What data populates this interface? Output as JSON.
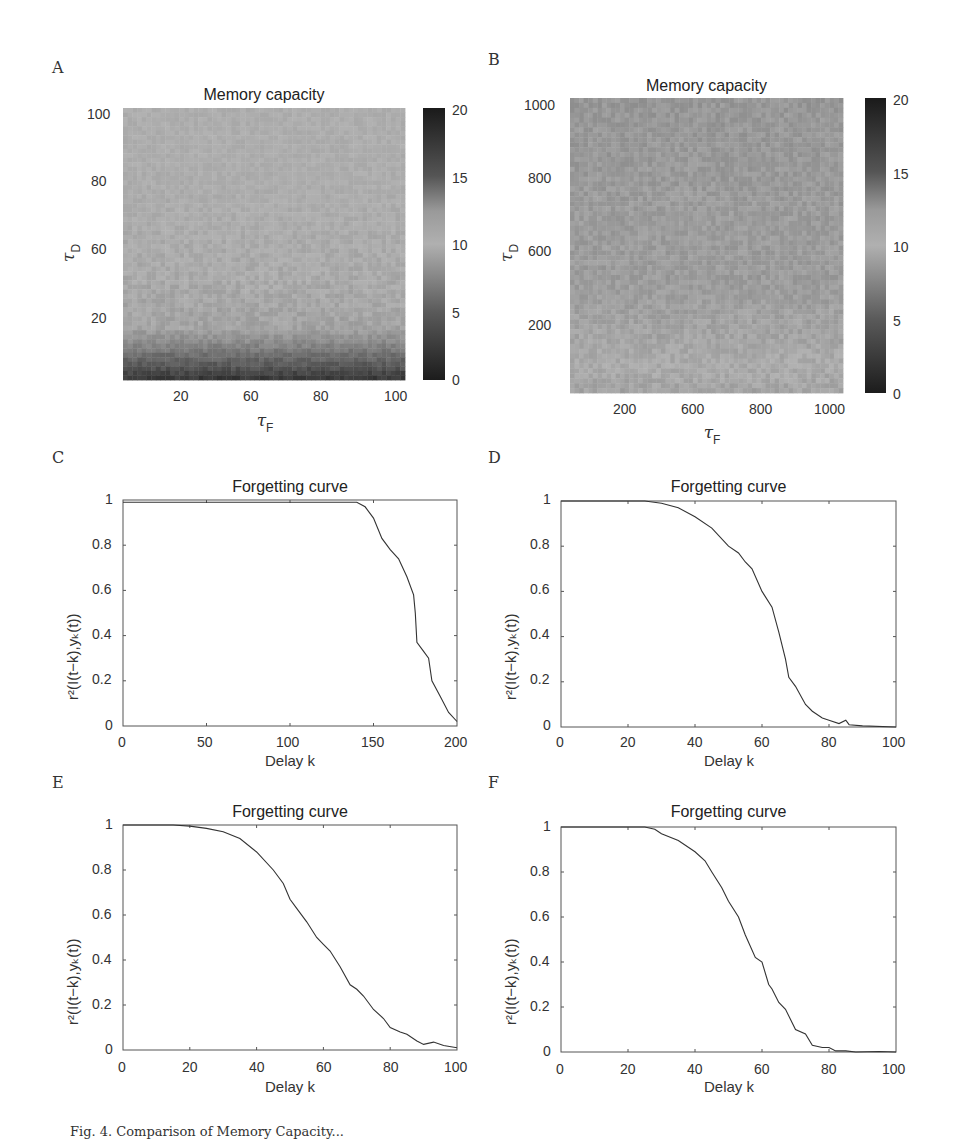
{
  "figure": {
    "caption_partial": "Fig. 4. Comparison of Memory Capacity...",
    "colors": {
      "line": "#333333",
      "axis": "#555555",
      "heat_low": "#1a1a1a",
      "heat_high_mid": "#9a9a9a"
    }
  },
  "panels": {
    "A": {
      "letter": "A",
      "title": "Memory capacity",
      "xlabel": "τ",
      "xlabel_sub": "F",
      "ylabel": "τ",
      "ylabel_sub": "D",
      "xticks": [
        "20",
        "60",
        "80",
        "100"
      ],
      "yticks": [
        "100",
        "80",
        "60",
        "20"
      ],
      "cbar_ticks": [
        "20",
        "15",
        "10",
        "5",
        "0"
      ]
    },
    "B": {
      "letter": "B",
      "title": "Memory capacity",
      "xlabel": "τ",
      "xlabel_sub": "F",
      "ylabel": "τ",
      "ylabel_sub": "D",
      "xticks": [
        "200",
        "600",
        "800",
        "1000"
      ],
      "yticks": [
        "1000",
        "800",
        "600",
        "200"
      ],
      "cbar_ticks": [
        "20",
        "15",
        "10",
        "5",
        "0"
      ]
    },
    "C": {
      "letter": "C",
      "title": "Forgetting curve",
      "xlabel": "Delay k",
      "ylabel": "r²(I(t−k),yₖ(t))",
      "xticks": [
        "0",
        "50",
        "100",
        "150",
        "200"
      ],
      "yticks": [
        "1",
        "0.8",
        "0.6",
        "0.4",
        "0.2",
        "0"
      ]
    },
    "D": {
      "letter": "D",
      "title": "Forgetting curve",
      "xlabel": "Delay k",
      "ylabel": "r²(I(t−k),yₖ(t))",
      "xticks": [
        "0",
        "20",
        "40",
        "60",
        "80",
        "100"
      ],
      "yticks": [
        "1",
        "0.8",
        "0.6",
        "0.4",
        "0.2",
        "0"
      ]
    },
    "E": {
      "letter": "E",
      "title": "Forgetting curve",
      "xlabel": "Delay k",
      "ylabel": "r²(I(t−k),yₖ(t))",
      "xticks": [
        "0",
        "20",
        "40",
        "60",
        "80",
        "100"
      ],
      "yticks": [
        "1",
        "0.8",
        "0.6",
        "0.4",
        "0.2",
        "0"
      ]
    },
    "F": {
      "letter": "F",
      "title": "Forgetting curve",
      "xlabel": "Delay k",
      "ylabel": "r²(I(t−k),yₖ(t))",
      "xticks": [
        "0",
        "20",
        "40",
        "60",
        "80",
        "100"
      ],
      "yticks": [
        "1",
        "0.8",
        "0.6",
        "0.4",
        "0.2",
        "0"
      ]
    }
  },
  "chart_data": [
    {
      "panel": "A",
      "type": "heatmap",
      "title": "Memory capacity",
      "xlabel": "τF",
      "ylabel": "τD",
      "xlim": [
        1,
        100
      ],
      "ylim": [
        1,
        100
      ],
      "xticks": [
        20,
        60,
        80,
        100
      ],
      "yticks": [
        20,
        60,
        80,
        100
      ],
      "colorbar": {
        "range": [
          0,
          20
        ],
        "ticks": [
          0,
          5,
          10,
          15,
          20
        ],
        "colormap": "gray (dark=high at 20, dark=low at 0, light≈10)"
      },
      "row_profile_tauD": [
        1,
        5,
        10,
        15,
        20,
        40,
        60,
        80,
        100
      ],
      "row_values": [
        1.5,
        3.5,
        5.5,
        7.5,
        9,
        9.5,
        9.8,
        10,
        10
      ]
    },
    {
      "panel": "B",
      "type": "heatmap",
      "title": "Memory capacity",
      "xlabel": "τF",
      "ylabel": "τD",
      "xlim": [
        1,
        1000
      ],
      "ylim": [
        1,
        1000
      ],
      "xticks": [
        200,
        600,
        800,
        1000
      ],
      "yticks": [
        200,
        600,
        800,
        1000
      ],
      "colorbar": {
        "range": [
          0,
          20
        ],
        "ticks": [
          0,
          5,
          10,
          15,
          20
        ]
      },
      "row_profile_tauD": [
        1,
        100,
        200,
        400,
        600,
        800,
        1000
      ],
      "row_values": [
        9,
        9.5,
        9,
        8.5,
        8.5,
        8.3,
        8.2
      ]
    },
    {
      "panel": "C",
      "type": "line",
      "title": "Forgetting curve",
      "xlabel": "Delay k",
      "ylabel": "r²(I(t−k),yₖ(t))",
      "xlim": [
        0,
        200
      ],
      "ylim": [
        0,
        1
      ],
      "x": [
        0,
        50,
        100,
        140,
        145,
        150,
        155,
        160,
        165,
        170,
        174,
        175,
        176,
        180,
        183,
        185,
        190,
        195,
        200
      ],
      "y": [
        0.99,
        0.99,
        0.99,
        0.99,
        0.97,
        0.92,
        0.83,
        0.78,
        0.74,
        0.66,
        0.58,
        0.5,
        0.37,
        0.33,
        0.3,
        0.2,
        0.13,
        0.06,
        0.02
      ]
    },
    {
      "panel": "D",
      "type": "line",
      "title": "Forgetting curve",
      "xlabel": "Delay k",
      "ylabel": "r²(I(t−k),yₖ(t))",
      "xlim": [
        0,
        100
      ],
      "ylim": [
        0,
        1
      ],
      "x": [
        0,
        25,
        30,
        35,
        40,
        45,
        50,
        53,
        55,
        57,
        60,
        63,
        65,
        67,
        68,
        70,
        73,
        75,
        78,
        80,
        83,
        85,
        86,
        90,
        100
      ],
      "y": [
        1.0,
        1.0,
        0.99,
        0.97,
        0.93,
        0.88,
        0.8,
        0.77,
        0.73,
        0.7,
        0.6,
        0.53,
        0.42,
        0.3,
        0.22,
        0.18,
        0.1,
        0.07,
        0.04,
        0.03,
        0.015,
        0.03,
        0.01,
        0.005,
        0.0
      ]
    },
    {
      "panel": "E",
      "type": "line",
      "title": "Forgetting curve",
      "xlabel": "Delay k",
      "ylabel": "r²(I(t−k),yₖ(t))",
      "xlim": [
        0,
        100
      ],
      "ylim": [
        0,
        1
      ],
      "x": [
        0,
        15,
        20,
        25,
        30,
        35,
        40,
        45,
        48,
        50,
        52,
        55,
        58,
        60,
        62,
        65,
        68,
        70,
        72,
        75,
        78,
        80,
        83,
        85,
        88,
        90,
        93,
        96,
        100
      ],
      "y": [
        1.0,
        1.0,
        0.995,
        0.985,
        0.97,
        0.94,
        0.88,
        0.8,
        0.74,
        0.67,
        0.63,
        0.57,
        0.5,
        0.47,
        0.44,
        0.37,
        0.29,
        0.27,
        0.24,
        0.18,
        0.14,
        0.1,
        0.08,
        0.07,
        0.04,
        0.025,
        0.035,
        0.02,
        0.01
      ]
    },
    {
      "panel": "F",
      "type": "line",
      "title": "Forgetting curve",
      "xlabel": "Delay k",
      "ylabel": "r²(I(t−k),yₖ(t))",
      "xlim": [
        0,
        100
      ],
      "ylim": [
        0,
        1
      ],
      "x": [
        0,
        25,
        28,
        30,
        35,
        40,
        43,
        45,
        48,
        50,
        53,
        55,
        58,
        60,
        62,
        63,
        65,
        67,
        70,
        73,
        75,
        78,
        80,
        82,
        85,
        88,
        95,
        100
      ],
      "y": [
        1.0,
        1.0,
        0.99,
        0.97,
        0.94,
        0.89,
        0.85,
        0.8,
        0.73,
        0.67,
        0.6,
        0.52,
        0.42,
        0.4,
        0.3,
        0.28,
        0.22,
        0.19,
        0.1,
        0.08,
        0.03,
        0.02,
        0.02,
        0.005,
        0.005,
        0.0,
        0.002,
        0.0
      ]
    }
  ]
}
